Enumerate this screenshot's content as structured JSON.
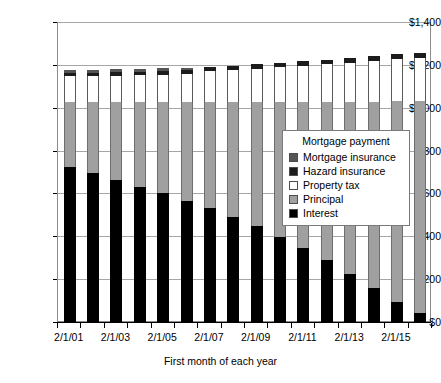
{
  "chart_data": {
    "type": "bar",
    "title": "",
    "subtitle": "",
    "stacked": true,
    "xlabel": "First month of each year",
    "ylabel": "",
    "ylim": [
      0,
      1400
    ],
    "ytick_step": 200,
    "grid": true,
    "legend_position": "inside-right",
    "legend_title": "Mortgage payment",
    "categories": [
      "2/1/01",
      "2/1/02",
      "2/1/03",
      "2/1/04",
      "2/1/05",
      "2/1/06",
      "2/1/07",
      "2/1/08",
      "2/1/09",
      "2/1/10",
      "2/1/11",
      "2/1/12",
      "2/1/13",
      "2/1/14",
      "2/1/15",
      "2/1/16"
    ],
    "xtick_labels": [
      "2/1/01",
      "",
      "2/1/03",
      "",
      "2/1/05",
      "",
      "2/1/07",
      "",
      "2/1/09",
      "",
      "2/1/11",
      "",
      "2/1/13",
      "",
      "2/1/15",
      ""
    ],
    "ytick_labels": [
      "$0",
      "$200",
      "$400",
      "$600",
      "$800",
      "$1,000",
      "$1,200",
      "$1,400"
    ],
    "ytick_values": [
      0,
      200,
      400,
      600,
      800,
      1000,
      1200,
      1400
    ],
    "series": [
      {
        "name": "Interest",
        "color": "#000000",
        "values": [
          725,
          695,
          663,
          630,
          600,
          567,
          530,
          490,
          446,
          398,
          345,
          288,
          226,
          158,
          95,
          40
        ]
      },
      {
        "name": "Principal",
        "color": "#a0a0a0",
        "values": [
          303,
          333,
          365,
          398,
          428,
          461,
          498,
          538,
          582,
          630,
          683,
          740,
          802,
          870,
          935,
          990
        ]
      },
      {
        "name": "Property tax",
        "color": "#ffffff",
        "values": [
          118,
          120,
          122,
          124,
          126,
          128,
          145,
          150,
          155,
          160,
          168,
          175,
          182,
          190,
          196,
          200
        ]
      },
      {
        "name": "Hazard insurance",
        "color": "#1c1c1c",
        "values": [
          16,
          16,
          17,
          17,
          18,
          18,
          19,
          19,
          20,
          20,
          21,
          22,
          23,
          24,
          25,
          26
        ]
      },
      {
        "name": "Mortgage insurance",
        "color": "#555555",
        "values": [
          13,
          13,
          13,
          13,
          13,
          13,
          0,
          0,
          0,
          0,
          0,
          0,
          0,
          0,
          0,
          0
        ]
      }
    ],
    "legend_entries": [
      {
        "label": "Mortgage insurance",
        "color": "#555555"
      },
      {
        "label": "Hazard insurance",
        "color": "#1c1c1c"
      },
      {
        "label": "Property tax",
        "color": "#ffffff"
      },
      {
        "label": "Principal",
        "color": "#a0a0a0"
      },
      {
        "label": "Interest",
        "color": "#000000"
      }
    ]
  }
}
